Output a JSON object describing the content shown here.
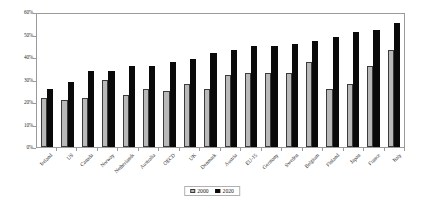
{
  "chart_data": {
    "type": "bar",
    "title": "",
    "xlabel": "",
    "ylabel": "",
    "ylim": [
      0,
      60
    ],
    "y_tick_labels": [
      "0%",
      "10%",
      "20%",
      "30%",
      "40%",
      "50%",
      "60%"
    ],
    "y_tick_values": [
      0,
      10,
      20,
      30,
      40,
      50,
      60
    ],
    "grid": false,
    "legend_position": "bottom-center",
    "categories": [
      "Ireland",
      "US",
      "Canada",
      "Norway",
      "Netherlands",
      "Australia",
      "OECD",
      "UK",
      "Denmark",
      "Austria",
      "EU-15",
      "Germany",
      "Sweden",
      "Belgium",
      "Finland",
      "Japan",
      "France",
      "Italy"
    ],
    "series": [
      {
        "name": "2000",
        "color": "#b9b9b9",
        "values": [
          22,
          21,
          22,
          30,
          23,
          26,
          25,
          28,
          26,
          32,
          33,
          33,
          33,
          38,
          26,
          28,
          36,
          43
        ]
      },
      {
        "name": "2020",
        "color": "#0a0a0a",
        "values": [
          26,
          29,
          34,
          34,
          36,
          36,
          38,
          39,
          42,
          43,
          45,
          45,
          46,
          47,
          49,
          51,
          52,
          55
        ]
      }
    ]
  },
  "legend": {
    "entries": [
      {
        "label": "2000"
      },
      {
        "label": "2020"
      }
    ]
  }
}
